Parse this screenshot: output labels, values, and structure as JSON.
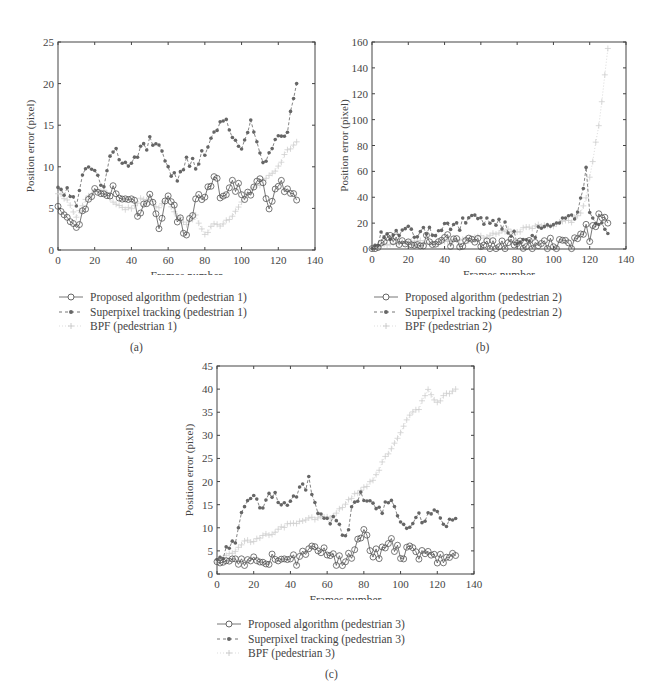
{
  "panels": [
    {
      "id": "a",
      "caption": "(a)",
      "xlabel": "Frames number",
      "ylabel": "Position error (pixel)",
      "xticks": [
        0,
        20,
        40,
        60,
        80,
        100,
        120,
        140
      ],
      "yticks": [
        0,
        5,
        10,
        15,
        20,
        25
      ],
      "legend": [
        "Proposed algorithm (pedestrian 1)",
        "Superpixel tracking (pedestrian 1)",
        "BPF (pedestrian 1)"
      ]
    },
    {
      "id": "b",
      "caption": "(b)",
      "xlabel": "Frames number",
      "ylabel": "Position error (pixel)",
      "xticks": [
        0,
        20,
        40,
        60,
        80,
        100,
        120,
        140
      ],
      "yticks": [
        0,
        20,
        40,
        60,
        80,
        100,
        120,
        140,
        160
      ],
      "legend": [
        "Proposed algorithm (pedestrian 2)",
        "Superpixel tracking (pedestrian 2)",
        "BPF (pedestrian 2)"
      ]
    },
    {
      "id": "c",
      "caption": "(c)",
      "xlabel": "Frames number",
      "ylabel": "Position error (pixel)",
      "xticks": [
        0,
        20,
        40,
        60,
        80,
        100,
        120,
        140
      ],
      "yticks": [
        0,
        5,
        10,
        15,
        20,
        25,
        30,
        35,
        40,
        45
      ],
      "legend": [
        "Proposed algorithm (pedestrian 3)",
        "Superpixel tracking (pedestrian 3)",
        "BPF (pedestrian 3)"
      ]
    }
  ],
  "colors": {
    "proposed": "#555555",
    "superpixel": "#666666",
    "bpf": "#cfcfcf",
    "axis": "#444444"
  },
  "chart_data": [
    {
      "type": "line",
      "title": "(a)",
      "xlabel": "Frames number",
      "ylabel": "Position error (pixel)",
      "xlim": [
        0,
        140
      ],
      "ylim": [
        0,
        25
      ],
      "grid": false,
      "legend_position": "below",
      "x": [
        0,
        5,
        10,
        15,
        20,
        25,
        30,
        35,
        40,
        45,
        50,
        55,
        60,
        65,
        70,
        75,
        80,
        85,
        90,
        95,
        100,
        105,
        110,
        115,
        120,
        125,
        130
      ],
      "series": [
        {
          "name": "Proposed algorithm (pedestrian 1)",
          "marker": "circle",
          "values": [
            6,
            4,
            2,
            5,
            7,
            7,
            7,
            6,
            6,
            4,
            7,
            2,
            7,
            4,
            2,
            6,
            6,
            9,
            6,
            8,
            7,
            6,
            9,
            5,
            8,
            7,
            6
          ]
        },
        {
          "name": "Superpixel tracking (pedestrian 1)",
          "marker": "asterisk",
          "values": [
            8,
            7,
            6,
            10,
            9,
            8,
            12,
            11,
            10,
            12,
            13,
            12,
            10,
            8,
            11,
            10,
            12,
            14,
            16,
            13,
            12,
            15,
            11,
            11,
            14,
            14,
            20
          ]
        },
        {
          "name": "BPF (pedestrian 1)",
          "marker": "plus",
          "values": [
            7,
            6,
            4,
            6,
            7,
            7,
            6,
            5,
            5,
            6,
            6,
            5,
            6,
            4,
            3,
            4,
            2,
            3,
            3,
            4,
            6,
            7,
            8,
            9,
            10,
            12,
            13
          ]
        }
      ]
    },
    {
      "type": "line",
      "title": "(b)",
      "xlabel": "Frames number",
      "ylabel": "Position error (pixel)",
      "xlim": [
        0,
        140
      ],
      "ylim": [
        0,
        160
      ],
      "grid": false,
      "legend_position": "below",
      "x": [
        0,
        5,
        10,
        15,
        20,
        25,
        30,
        35,
        40,
        45,
        50,
        55,
        60,
        65,
        70,
        75,
        80,
        85,
        90,
        95,
        100,
        105,
        110,
        115,
        118,
        120,
        125,
        130
      ],
      "series": [
        {
          "name": "Proposed algorithm (pedestrian 2)",
          "marker": "circle",
          "values": [
            2,
            5,
            6,
            4,
            3,
            5,
            6,
            3,
            8,
            5,
            4,
            4,
            5,
            3,
            3,
            4,
            2,
            3,
            2,
            4,
            4,
            3,
            3,
            12,
            20,
            8,
            25,
            20
          ]
        },
        {
          "name": "Superpixel tracking (pedestrian 2)",
          "marker": "asterisk",
          "values": [
            3,
            10,
            12,
            12,
            14,
            12,
            13,
            14,
            17,
            16,
            20,
            22,
            24,
            18,
            22,
            14,
            8,
            6,
            12,
            14,
            18,
            20,
            22,
            35,
            60,
            30,
            18,
            12
          ]
        },
        {
          "name": "BPF (pedestrian 2)",
          "marker": "plus",
          "values": [
            1,
            3,
            4,
            4,
            5,
            5,
            6,
            4,
            6,
            6,
            7,
            7,
            9,
            10,
            12,
            14,
            14,
            16,
            17,
            18,
            19,
            20,
            22,
            28,
            40,
            55,
            95,
            155
          ]
        }
      ]
    },
    {
      "type": "line",
      "title": "(c)",
      "xlabel": "Frames number",
      "ylabel": "Position error (pixel)",
      "xlim": [
        0,
        140
      ],
      "ylim": [
        0,
        45
      ],
      "grid": false,
      "legend_position": "below",
      "x": [
        0,
        5,
        10,
        15,
        20,
        25,
        30,
        35,
        40,
        45,
        50,
        55,
        60,
        65,
        70,
        75,
        80,
        85,
        90,
        95,
        100,
        105,
        110,
        115,
        120,
        125,
        130
      ],
      "series": [
        {
          "name": "Proposed algorithm (pedestrian 3)",
          "marker": "circle",
          "values": [
            4,
            3,
            2,
            2,
            3,
            3,
            3,
            3,
            3,
            3,
            6,
            4,
            5,
            3,
            3,
            5,
            9,
            4,
            5,
            7,
            4,
            5,
            4,
            5,
            3,
            3,
            4
          ]
        },
        {
          "name": "Superpixel tracking (pedestrian 3)",
          "marker": "asterisk",
          "values": [
            4,
            5,
            8,
            15,
            16,
            15,
            17,
            16,
            15,
            18,
            20,
            12,
            12,
            11,
            8,
            16,
            17,
            15,
            14,
            15,
            11,
            9,
            12,
            12,
            14,
            10,
            12
          ]
        },
        {
          "name": "BPF (pedestrian 3)",
          "marker": "plus",
          "values": [
            3,
            4,
            5,
            7,
            7,
            8,
            9,
            10,
            11,
            11,
            12,
            12,
            12,
            13,
            15,
            17,
            19,
            20,
            24,
            27,
            31,
            34,
            36,
            40,
            37,
            39,
            40
          ]
        }
      ]
    }
  ]
}
